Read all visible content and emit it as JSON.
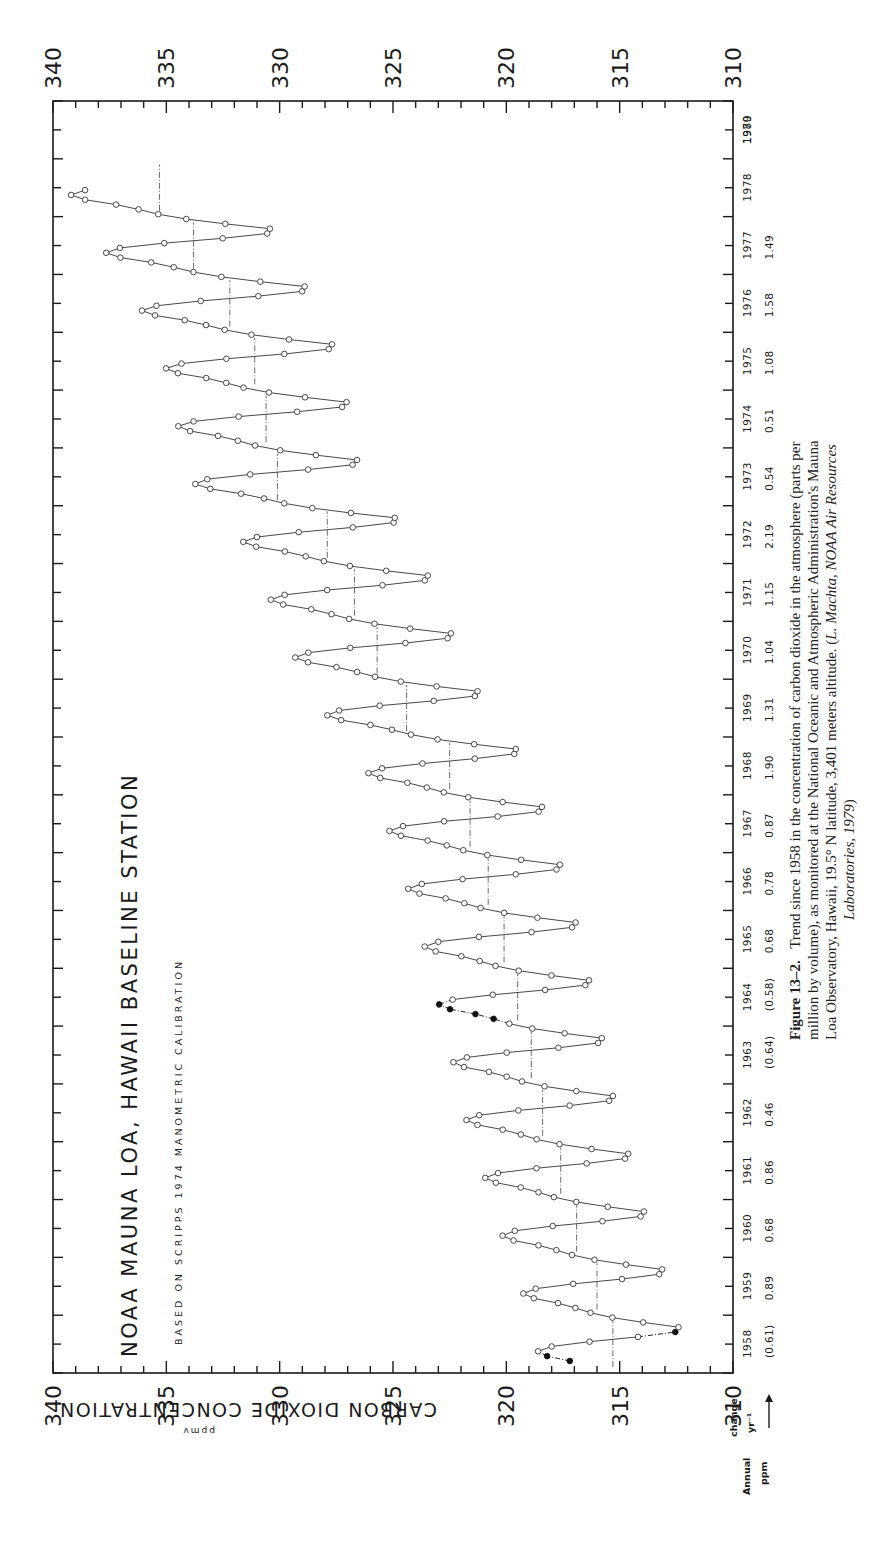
{
  "figure": {
    "title": "NOAA MAUNA LOA, HAWAII BASELINE STATION",
    "subtitle": "BASED ON SCRIPPS 1974 MANOMETRIC CALIBRATION",
    "y_axis_label": "CARBON DIOXIDE CONCENTRATION",
    "y_axis_units": "ppmv",
    "annual_change_label": [
      "Annual",
      "change",
      "ppm",
      "yr⁻¹"
    ],
    "annual_change_arrow": "→",
    "caption": {
      "label": "Figure 13–2.",
      "lines": [
        "Trend since 1958 in the concentration of carbon dioxide in the atmosphere (parts per",
        "million by volume), as monitored at the National Oceanic and Atmospheric Administration's Mauna",
        "Loa Observatory, Hawaii, 19.5° N latitude, 3,401 meters altitude. (",
        "Laboratories, 1979)"
      ],
      "line3_italic": "L. Machta, NOAA Air Resources",
      "line4_italic": "Laboratories, 1979",
      "line4_tail": ")"
    }
  },
  "chart_data": {
    "type": "line",
    "orientation": "rotated 90° counter-clockwise (time runs bottom-to-top, concentration increases right-to-left)",
    "title": "NOAA MAUNA LOA, HAWAII BASELINE STATION",
    "subtitle": "BASED ON SCRIPPS 1974 MANOMETRIC CALIBRATION",
    "xlabel": "Year",
    "ylabel": "CARBON DIOXIDE CONCENTRATION (ppmv)",
    "ylim": [
      310,
      340
    ],
    "xlim": [
      1958,
      1980
    ],
    "ppm_ticks": [
      340,
      335,
      330,
      325,
      320,
      315,
      310
    ],
    "ppm_minor_step": 1,
    "year_ticks": [
      1958,
      1959,
      1960,
      1961,
      1962,
      1963,
      1964,
      1965,
      1966,
      1967,
      1968,
      1969,
      1970,
      1971,
      1972,
      1973,
      1974,
      1975,
      1976,
      1977,
      1978,
      1979,
      1980
    ],
    "annual_change_ppm_per_yr": [
      {
        "year": 1958,
        "value": "(0.61)"
      },
      {
        "year": 1959,
        "value": "0.89"
      },
      {
        "year": 1960,
        "value": "0.68"
      },
      {
        "year": 1961,
        "value": "0.86"
      },
      {
        "year": 1962,
        "value": "0.46"
      },
      {
        "year": 1963,
        "value": "(0.64)"
      },
      {
        "year": 1964,
        "value": "(0.58)"
      },
      {
        "year": 1965,
        "value": "0.68"
      },
      {
        "year": 1966,
        "value": "0.78"
      },
      {
        "year": 1967,
        "value": "0.87"
      },
      {
        "year": 1968,
        "value": "1.90"
      },
      {
        "year": 1969,
        "value": "1.31"
      },
      {
        "year": 1970,
        "value": "1.04"
      },
      {
        "year": 1971,
        "value": "1.15"
      },
      {
        "year": 1972,
        "value": "2.19"
      },
      {
        "year": 1973,
        "value": "0.54"
      },
      {
        "year": 1974,
        "value": "0.51"
      },
      {
        "year": 1975,
        "value": "1.08"
      },
      {
        "year": 1976,
        "value": "1.58"
      },
      {
        "year": 1977,
        "value": "1.49"
      }
    ],
    "annual_means_ppm": [
      {
        "year": 1958,
        "value": 315.3
      },
      {
        "year": 1959,
        "value": 316.0
      },
      {
        "year": 1960,
        "value": 316.9
      },
      {
        "year": 1961,
        "value": 317.6
      },
      {
        "year": 1962,
        "value": 318.4
      },
      {
        "year": 1963,
        "value": 318.9
      },
      {
        "year": 1964,
        "value": 319.5
      },
      {
        "year": 1965,
        "value": 320.1
      },
      {
        "year": 1966,
        "value": 320.8
      },
      {
        "year": 1967,
        "value": 321.6
      },
      {
        "year": 1968,
        "value": 322.5
      },
      {
        "year": 1969,
        "value": 324.4
      },
      {
        "year": 1970,
        "value": 325.7
      },
      {
        "year": 1971,
        "value": 326.7
      },
      {
        "year": 1972,
        "value": 327.9
      },
      {
        "year": 1973,
        "value": 330.1
      },
      {
        "year": 1974,
        "value": 330.6
      },
      {
        "year": 1975,
        "value": 331.1
      },
      {
        "year": 1976,
        "value": 332.2
      },
      {
        "year": 1977,
        "value": 333.8
      },
      {
        "year": 1978,
        "value": 335.3
      }
    ],
    "seasonal_cycle": {
      "peak_month": "May",
      "trough_month": "September-October",
      "amplitude_ppm_peak_to_trough": 5.5
    },
    "estimated_gap_months": "March 1958 - April 1958 and February 1964 - May 1964 (shown as filled points joined by dash-dot line)",
    "series": [
      {
        "name": "Monthly mean CO2 (ppmv)",
        "marker": "open circle",
        "start": "1958-03",
        "end": "1978-06"
      }
    ]
  },
  "axes_geometry": {
    "frame": {
      "left": 53,
      "top": 101,
      "right": 733,
      "bottom": 1373
    },
    "ppm_at_left": 340,
    "ppm_at_right": 310,
    "year_at_bottom": 1958,
    "year_at_top": 1980
  }
}
